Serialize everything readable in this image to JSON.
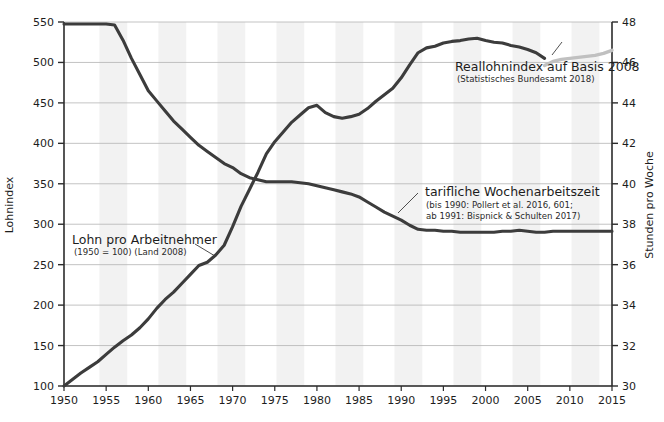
{
  "chart_data": {
    "type": "line",
    "title": "",
    "xlabel": "",
    "grid": true,
    "legend_position": "inline-annotations",
    "x_axis": {
      "ticks": [
        1950,
        1955,
        1960,
        1965,
        1970,
        1975,
        1980,
        1985,
        1990,
        1995,
        2000,
        2005,
        2010,
        2015
      ],
      "tick_labels": [
        "1950",
        "1955",
        "1960",
        "1965",
        "1970",
        "1975",
        "1980",
        "1985",
        "1990",
        "1995",
        "2000",
        "2005",
        "2010",
        "2015"
      ],
      "xlim": [
        1950,
        2015
      ]
    },
    "y_axis_left": {
      "label": "Lohnindex",
      "ticks": [
        100,
        150,
        200,
        250,
        300,
        350,
        400,
        450,
        500,
        550
      ],
      "tick_labels": [
        "100",
        "150",
        "200",
        "250",
        "300",
        "350",
        "400",
        "450",
        "500",
        "550"
      ],
      "ylim": [
        100,
        550
      ]
    },
    "y_axis_right": {
      "label": "Stunden pro Woche",
      "ticks": [
        30,
        32,
        34,
        36,
        38,
        40,
        42,
        44,
        46,
        48
      ],
      "tick_labels": [
        "30",
        "32",
        "34",
        "36",
        "38",
        "40",
        "42",
        "44",
        "46",
        "48"
      ],
      "ylim": [
        30,
        48
      ]
    },
    "series": [
      {
        "name": "Lohn pro Arbeitnehmer",
        "axis": "left",
        "color": "#3c3c3c",
        "annotation_title": "Lohn pro Arbeitnehmer",
        "annotation_sub": "(1950 = 100) (Land 2008)",
        "x": [
          1950,
          1951,
          1952,
          1953,
          1954,
          1955,
          1956,
          1957,
          1958,
          1959,
          1960,
          1961,
          1962,
          1963,
          1964,
          1965,
          1966,
          1967,
          1968,
          1969,
          1970,
          1971,
          1972,
          1973,
          1974,
          1975,
          1976,
          1977,
          1978,
          1979,
          1980,
          1981,
          1982,
          1983,
          1984,
          1985,
          1986,
          1987,
          1988,
          1989,
          1990,
          1991,
          1992,
          1993,
          1994,
          1995,
          1996,
          1997,
          1998,
          1999,
          2000,
          2001,
          2002,
          2003,
          2004,
          2005,
          2006,
          2007
        ],
        "y": [
          100,
          108,
          116,
          123,
          130,
          139,
          148,
          156,
          163,
          172,
          183,
          196,
          207,
          216,
          227,
          238,
          249,
          253,
          262,
          274,
          297,
          322,
          343,
          364,
          387,
          402,
          414,
          426,
          435,
          444,
          447,
          438,
          433,
          431,
          433,
          436,
          443,
          452,
          460,
          468,
          481,
          497,
          512,
          518,
          520,
          524,
          526,
          527,
          529,
          530,
          527,
          525,
          524,
          521,
          519,
          516,
          512,
          505
        ]
      },
      {
        "name": "Reallohnindex auf Basis 2008",
        "axis": "right",
        "color": "#c0c0c0",
        "annotation_title": "Reallohnindex auf Basis 2008",
        "annotation_sub": "(Statistisches Bundesamt 2018)",
        "x": [
          2007,
          2008,
          2009,
          2010,
          2011,
          2012,
          2013,
          2014,
          2015
        ],
        "y": [
          45.85,
          46.05,
          46.15,
          46.2,
          46.25,
          46.3,
          46.35,
          46.45,
          46.6
        ]
      },
      {
        "name": "tarifliche Wochenarbeitszeit",
        "axis": "right",
        "color": "#3c3c3c",
        "annotation_title": "tarifliche Wochenarbeitszeit",
        "annotation_sub_line1": "(bis 1990: Pollert et al. 2016, 601;",
        "annotation_sub_line2": "ab 1991: Bispnick & Schulten 2017)",
        "x": [
          1950,
          1951,
          1952,
          1953,
          1954,
          1955,
          1956,
          1957,
          1958,
          1959,
          1960,
          1961,
          1962,
          1963,
          1964,
          1965,
          1966,
          1967,
          1968,
          1969,
          1970,
          1971,
          1972,
          1973,
          1974,
          1975,
          1976,
          1977,
          1978,
          1979,
          1980,
          1981,
          1982,
          1983,
          1984,
          1985,
          1986,
          1987,
          1988,
          1989,
          1990,
          1991,
          1992,
          1993,
          1994,
          1995,
          1996,
          1997,
          1998,
          1999,
          2000,
          2001,
          2002,
          2003,
          2004,
          2005,
          2006,
          2007,
          2008,
          2009,
          2010,
          2011,
          2012,
          2013,
          2014,
          2015
        ],
        "y": [
          47.9,
          47.9,
          47.9,
          47.9,
          47.9,
          47.9,
          47.85,
          47.1,
          46.2,
          45.4,
          44.6,
          44.1,
          43.6,
          43.1,
          42.7,
          42.3,
          41.9,
          41.6,
          41.3,
          41.0,
          40.8,
          40.5,
          40.3,
          40.2,
          40.1,
          40.1,
          40.1,
          40.1,
          40.05,
          40.0,
          39.9,
          39.8,
          39.7,
          39.6,
          39.5,
          39.35,
          39.1,
          38.85,
          38.6,
          38.4,
          38.2,
          37.95,
          37.75,
          37.7,
          37.7,
          37.65,
          37.65,
          37.6,
          37.6,
          37.6,
          37.6,
          37.6,
          37.65,
          37.65,
          37.7,
          37.65,
          37.6,
          37.6,
          37.65,
          37.65,
          37.65,
          37.65,
          37.65,
          37.65,
          37.65,
          37.65
        ]
      }
    ],
    "annotations": [
      {
        "id": "ann-wage",
        "title": "Lohn pro Arbeitnehmer",
        "sub": "(1950 = 100) (Land 2008)"
      },
      {
        "id": "ann-real",
        "title": "Reallohnindex auf Basis 2008",
        "sub": "(Statistisches Bundesamt 2018)"
      },
      {
        "id": "ann-hours",
        "title": "tarifliche Wochenarbeitszeit",
        "sub1": "(bis 1990: Pollert et al. 2016, 601;",
        "sub2": "ab 1991: Bispnick & Schulten 2017)"
      }
    ],
    "colors": {
      "line_dark": "#3c3c3c",
      "line_light": "#c0c0c0",
      "grid": "#b4b4b4",
      "axis": "#2b2b2b",
      "band": "#f2f2f2",
      "background": "#ffffff"
    },
    "shaded_bands": [
      [
        1954.2,
        1957.5
      ],
      [
        1961.2,
        1964.5
      ],
      [
        1968.2,
        1971.5
      ],
      [
        1975.2,
        1978.5
      ],
      [
        1982.2,
        1985.5
      ],
      [
        1989.2,
        1992.5
      ],
      [
        1996.2,
        1999.5
      ],
      [
        2003.2,
        2006.5
      ],
      [
        2010.2,
        2013.5
      ]
    ]
  }
}
